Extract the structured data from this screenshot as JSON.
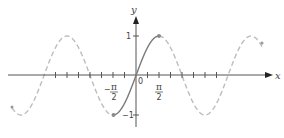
{
  "chart_data": {
    "type": "line",
    "title": "",
    "xlabel": "x",
    "ylabel": "y",
    "function": "y = sin x",
    "xlim": [
      -5.5,
      5.7
    ],
    "ylim": [
      -1.3,
      1.9
    ],
    "grid": false,
    "x_ticks": [
      -5.498,
      -4.712,
      -3.927,
      -3.142,
      -2.356,
      -1.571,
      -0.785,
      0,
      0.785,
      1.571,
      2.356,
      3.142,
      3.927,
      4.712,
      5.498
    ],
    "x_tick_labels": [
      {
        "x": -1.5708,
        "label": "-π/2"
      },
      {
        "x": 1.5708,
        "label": "π/2"
      }
    ],
    "origin_label": "0",
    "y_ticks": [
      1,
      -1
    ],
    "y_tick_labels": [
      "1",
      "-1"
    ],
    "series": [
      {
        "name": "sin x on [-π/2, π/2]",
        "style": "solid",
        "color": "#7a7a7a",
        "x": [
          -1.5708,
          -0.7854,
          0,
          0.7854,
          1.5708
        ],
        "y": [
          -1,
          -0.7071,
          0,
          0.7071,
          1
        ]
      },
      {
        "name": "sin x (rest of domain)",
        "style": "dashed",
        "color": "#bdbdbd",
        "x": [
          -5.5,
          -4.712,
          -3.142,
          -1.571,
          1.571,
          3.142,
          4.712,
          5.4
        ],
        "y": [
          0.706,
          1,
          0,
          -1,
          1,
          0,
          -1,
          0.77
        ]
      }
    ],
    "highlighted_points": [
      {
        "x": -1.5708,
        "y": -1
      },
      {
        "x": 1.5708,
        "y": 1
      }
    ]
  },
  "labels": {
    "x_axis": "x",
    "y_axis": "y",
    "origin": "0",
    "y_one": "1",
    "y_neg_one": "−1",
    "pi": "π",
    "two": "2",
    "minus": "−"
  },
  "colors": {
    "axis": "#555555",
    "solid_curve": "#7a7a7a",
    "dashed_curve": "#bdbdbd",
    "point": "#8a8a8a"
  }
}
